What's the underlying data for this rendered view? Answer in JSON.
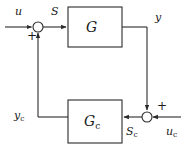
{
  "diagram": {
    "type": "control-system-block-diagram",
    "canvas": {
      "width": 185,
      "height": 148
    },
    "stroke_color": "#2b2b2b",
    "text_color": "#1a1a1a",
    "background": "#ffffff",
    "blocks": [
      {
        "id": "plant",
        "name": "G",
        "subscript": "",
        "x": 68,
        "y": 7,
        "w": 54,
        "h": 40
      },
      {
        "id": "controller",
        "name": "G",
        "subscript": "c",
        "x": 68,
        "y": 100,
        "w": 54,
        "h": 43
      }
    ],
    "junctions": [
      {
        "id": "sum-top-left",
        "cx": 38,
        "cy": 27,
        "r": 5,
        "sign": "+"
      },
      {
        "id": "sum-bottom-right",
        "cx": 147,
        "cy": 117,
        "r": 5,
        "sign": "+"
      }
    ],
    "signals": [
      {
        "id": "u",
        "label": "u",
        "subscript": "",
        "x": 15,
        "y": 6
      },
      {
        "id": "S",
        "label": "S",
        "subscript": "",
        "x": 51,
        "y": 6
      },
      {
        "id": "y",
        "label": "y",
        "subscript": "",
        "x": 155,
        "y": 12
      },
      {
        "id": "yc",
        "label": "y",
        "subscript": "c",
        "x": 14,
        "y": 110
      },
      {
        "id": "Sc",
        "label": "S",
        "subscript": "c",
        "x": 126,
        "y": 126
      },
      {
        "id": "uc",
        "label": "u",
        "subscript": "c",
        "x": 166,
        "y": 126
      }
    ],
    "sign_marks": [
      {
        "id": "plus-top-left",
        "symbol": "+",
        "x": 27,
        "y": 30
      },
      {
        "id": "plus-bottom-right",
        "symbol": "+",
        "x": 157,
        "y": 100
      }
    ]
  }
}
